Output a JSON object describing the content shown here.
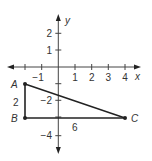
{
  "diagram": {
    "type": "coordinate-plane-triangle",
    "axes": {
      "x_label": "x",
      "y_label": "y",
      "x_ticks": [
        {
          "value": -2,
          "label": ""
        },
        {
          "value": -1,
          "label": "−1"
        },
        {
          "value": 1,
          "label": "1"
        },
        {
          "value": 2,
          "label": "2"
        },
        {
          "value": 3,
          "label": "3"
        },
        {
          "value": 4,
          "label": "4"
        }
      ],
      "y_ticks": [
        {
          "value": 2,
          "label": "2"
        },
        {
          "value": 1,
          "label": "1"
        },
        {
          "value": -1,
          "label": ""
        },
        {
          "value": -2,
          "label": "−2"
        },
        {
          "value": -3,
          "label": ""
        },
        {
          "value": -4,
          "label": "−4"
        }
      ]
    },
    "points": [
      {
        "name": "A",
        "x": -2,
        "y": -1
      },
      {
        "name": "B",
        "x": -2,
        "y": -3
      },
      {
        "name": "C",
        "x": 4,
        "y": -3
      }
    ],
    "side_labels": {
      "AB": "2",
      "BC": "6"
    },
    "colors": {
      "line": "#222222",
      "text": "#333333",
      "axis": "#444444"
    }
  }
}
